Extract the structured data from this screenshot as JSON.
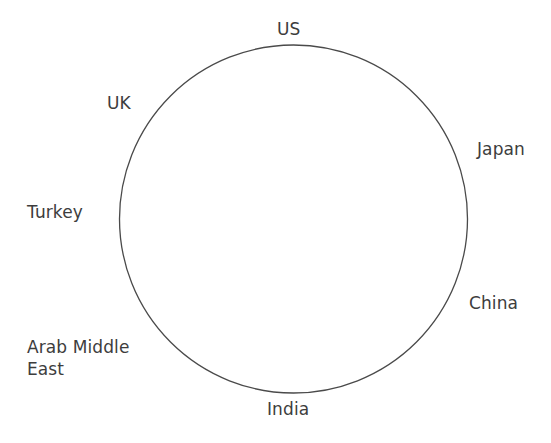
{
  "diagram": {
    "type": "circle-of-nodes",
    "title": "",
    "background_color": "#ffffff",
    "shape": {
      "name": "circle",
      "stroke_color": "#4a4a4a",
      "stroke_width": 1.3,
      "fill": "none",
      "center_x": 293.5,
      "center_y": 219,
      "radius": 174
    },
    "text_color": "#3d3d3d",
    "nodes": [
      {
        "id": "us",
        "label": "US",
        "position": "top",
        "angle_deg": 90
      },
      {
        "id": "uk",
        "label": "UK",
        "position": "upper-left",
        "angle_deg": 135
      },
      {
        "id": "japan",
        "label": "Japan",
        "position": "upper-right",
        "angle_deg": 35
      },
      {
        "id": "turkey",
        "label": "Turkey",
        "position": "left",
        "angle_deg": 180
      },
      {
        "id": "china",
        "label": "China",
        "position": "lower-right",
        "angle_deg": 325
      },
      {
        "id": "arab-middle-east",
        "label": "Arab Middle\nEast",
        "position": "lower-left",
        "angle_deg": 215
      },
      {
        "id": "india",
        "label": "India",
        "position": "bottom",
        "angle_deg": 270
      }
    ]
  }
}
